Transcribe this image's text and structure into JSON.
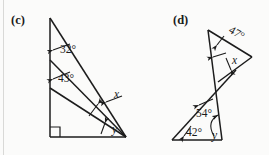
{
  "page": {
    "width": 269,
    "height": 155,
    "background_color": "#fbfbfa",
    "ink_color": "#1c1c1c"
  },
  "figures": [
    {
      "id": "c",
      "label": "(c)",
      "description": "right triangle with two cevians from the top-left vertex",
      "right_angle_at": "bottom-left",
      "angles": [
        {
          "name": "angle-32",
          "text": "32°",
          "type": "given",
          "x": 60,
          "y": 53
        },
        {
          "name": "angle-43",
          "text": "43°",
          "type": "given",
          "x": 58,
          "y": 82
        },
        {
          "name": "angle-x",
          "text": "x",
          "type": "unknown",
          "x": 114,
          "y": 98
        },
        {
          "name": "angle-y",
          "text": "y",
          "type": "unknown",
          "x": 112,
          "y": 132
        }
      ]
    },
    {
      "id": "d",
      "label": "(d)",
      "description": "two triangles meeting at a crossing point on a shared transversal",
      "angles": [
        {
          "name": "angle-47",
          "text": "47°",
          "type": "given",
          "x": 228,
          "y": 27
        },
        {
          "name": "angle-x",
          "text": "x",
          "type": "unknown",
          "x": 233,
          "y": 62
        },
        {
          "name": "angle-54",
          "text": "54°",
          "type": "given",
          "x": 197,
          "y": 113
        },
        {
          "name": "angle-42",
          "text": "42°",
          "type": "given",
          "x": 186,
          "y": 133
        },
        {
          "name": "angle-y",
          "text": "y",
          "type": "unknown",
          "x": 213,
          "y": 136
        }
      ]
    }
  ]
}
